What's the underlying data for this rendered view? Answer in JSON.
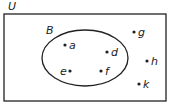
{
  "diagram": {
    "universal_set_label": "U",
    "set_label": "B",
    "points": [
      {
        "name": "a",
        "in_set": true
      },
      {
        "name": "d",
        "in_set": true
      },
      {
        "name": "e",
        "in_set": true
      },
      {
        "name": "f",
        "in_set": true
      },
      {
        "name": "g",
        "in_set": false
      },
      {
        "name": "h",
        "in_set": false
      },
      {
        "name": "k",
        "in_set": false
      }
    ],
    "colors": {
      "stroke": "#222222",
      "background": "#ffffff"
    }
  }
}
